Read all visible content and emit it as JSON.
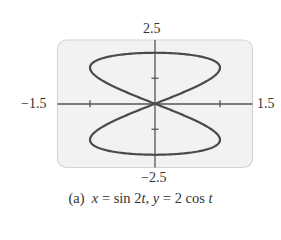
{
  "chart_data": {
    "type": "line",
    "subtype": "parametric",
    "title": "",
    "caption": "(a)  x = sin 2t, y = 2 cos t",
    "caption_parts": {
      "tag": "(a)",
      "x_var": "x",
      "x_expr_pre": " = sin 2",
      "t1": "t",
      "sep": ", ",
      "y_var": "y",
      "y_expr_pre": " = 2 cos ",
      "t2": "t"
    },
    "x_expr": "sin(2t)",
    "y_expr": "2cos(t)",
    "t_range": [
      0,
      6.283185
    ],
    "xlabel": "",
    "ylabel": "",
    "xlim": [
      -1.5,
      1.5
    ],
    "ylim": [
      -2.5,
      2.5
    ],
    "x_ticks": [
      -1,
      1
    ],
    "y_ticks": [
      -2,
      -1,
      1,
      2
    ],
    "axis_labels": {
      "x_min": "−1.5",
      "x_max": "1.5",
      "y_max": "2.5",
      "y_min": "−2.5"
    },
    "grid": false,
    "legend": null,
    "series": [
      {
        "name": "x = sin 2t, y = 2 cos t",
        "points_sampled": [
          {
            "t": 0,
            "x": 0,
            "y": 2
          },
          {
            "t": 0.785,
            "x": 1,
            "y": 1.414
          },
          {
            "t": 1.571,
            "x": 0,
            "y": 0
          },
          {
            "t": 2.356,
            "x": -1,
            "y": -1.414
          },
          {
            "t": 3.142,
            "x": 0,
            "y": -2
          },
          {
            "t": 3.927,
            "x": 1,
            "y": -1.414
          },
          {
            "t": 4.712,
            "x": 0,
            "y": 0
          },
          {
            "t": 5.498,
            "x": -1,
            "y": 1.414
          },
          {
            "t": 6.283,
            "x": 0,
            "y": 2
          }
        ]
      }
    ]
  },
  "colors": {
    "panel_fill": "#f2f2f2",
    "panel_border": "#d4d4d4",
    "axis": "#555555",
    "curve": "#4a4a4a",
    "text": "#333333"
  }
}
